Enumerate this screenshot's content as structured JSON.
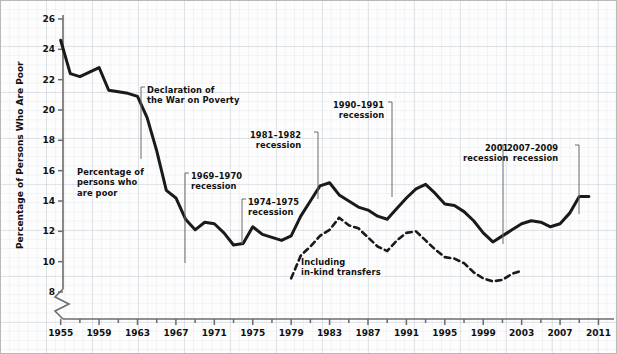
{
  "chart_data": {
    "type": "line",
    "title": "",
    "xlabel": "",
    "ylabel": "Percentage of Persons Who Are Poor",
    "xlim": [
      1954,
      2012
    ],
    "ylim": [
      7.2,
      26
    ],
    "y_axis_break": true,
    "grid": true,
    "legend_position": "inline-annotations",
    "y_ticks": [
      8,
      10,
      12,
      14,
      16,
      18,
      20,
      22,
      24,
      26
    ],
    "x_ticks": [
      1955,
      1959,
      1963,
      1967,
      1971,
      1975,
      1979,
      1983,
      1987,
      1991,
      1995,
      1999,
      2003,
      2007,
      2011
    ],
    "x_minor_tick_step": 2,
    "series": [
      {
        "name": "Percentage of persons who are poor",
        "style": "solid",
        "color": "#1a1a1a",
        "x": [
          1955,
          1956,
          1957,
          1958,
          1959,
          1960,
          1961,
          1962,
          1963,
          1964,
          1965,
          1966,
          1967,
          1968,
          1969,
          1970,
          1971,
          1972,
          1973,
          1974,
          1975,
          1976,
          1977,
          1978,
          1979,
          1980,
          1981,
          1982,
          1983,
          1984,
          1985,
          1986,
          1987,
          1988,
          1989,
          1990,
          1991,
          1992,
          1993,
          1994,
          1995,
          1996,
          1997,
          1998,
          1999,
          2000,
          2001,
          2002,
          2003,
          2004,
          2005,
          2006,
          2007,
          2008,
          2009,
          2010
        ],
        "values": [
          24.6,
          22.4,
          22.2,
          22.5,
          22.8,
          21.3,
          21.2,
          21.1,
          20.9,
          19.5,
          17.3,
          14.7,
          14.2,
          12.8,
          12.1,
          12.6,
          12.5,
          11.9,
          11.1,
          11.2,
          12.3,
          11.8,
          11.6,
          11.4,
          11.7,
          13.0,
          14.0,
          15.0,
          15.2,
          14.4,
          14.0,
          13.6,
          13.4,
          13.0,
          12.8,
          13.5,
          14.2,
          14.8,
          15.1,
          14.5,
          13.8,
          13.7,
          13.3,
          12.7,
          11.9,
          11.3,
          11.7,
          12.1,
          12.5,
          12.7,
          12.6,
          12.3,
          12.5,
          13.2,
          14.3,
          14.3
        ]
      },
      {
        "name": "Including in-kind transfers",
        "style": "dashed",
        "color": "#1a1a1a",
        "x": [
          1979,
          1980,
          1981,
          1982,
          1983,
          1984,
          1985,
          1986,
          1987,
          1988,
          1989,
          1990,
          1991,
          1992,
          1993,
          1994,
          1995,
          1996,
          1997,
          1998,
          1999,
          2000,
          2001,
          2002,
          2003
        ],
        "values": [
          8.9,
          10.4,
          11.0,
          11.7,
          12.1,
          12.9,
          12.4,
          12.2,
          11.6,
          11.0,
          10.7,
          11.4,
          11.9,
          12.0,
          11.4,
          10.8,
          10.3,
          10.2,
          9.9,
          9.3,
          8.9,
          8.7,
          8.8,
          9.2,
          9.4
        ]
      }
    ],
    "annotations": [
      {
        "id": "war-on-poverty",
        "lines": [
          "Declaration of",
          "the War on Poverty"
        ],
        "align": "left",
        "year": 1964
      },
      {
        "id": "poor-series-label",
        "lines": [
          "Percentage of",
          "persons who",
          "are poor"
        ],
        "align": "left"
      },
      {
        "id": "recession-1969-1970",
        "lines": [
          "1969–1970",
          "recession"
        ],
        "align": "left",
        "year": 1970
      },
      {
        "id": "recession-1974-1975",
        "lines": [
          "1974–1975",
          "recession"
        ],
        "align": "left",
        "year": 1975
      },
      {
        "id": "recession-1981-1982",
        "lines": [
          "1981–1982",
          "recession"
        ],
        "align": "right",
        "year": 1982
      },
      {
        "id": "recession-1990-1991",
        "lines": [
          "1990–1991",
          "recession"
        ],
        "align": "right",
        "year": 1991
      },
      {
        "id": "recession-2001",
        "lines": [
          "2001",
          "recession"
        ],
        "align": "right",
        "year": 2001
      },
      {
        "id": "recession-2007-2009",
        "lines": [
          "2007–2009",
          "recession"
        ],
        "align": "right",
        "year": 2008
      },
      {
        "id": "in-kind-label",
        "lines": [
          "Including",
          "in-kind transfers"
        ],
        "align": "left"
      }
    ]
  },
  "annotations_text": {
    "war_on_poverty_l1": "Declaration of",
    "war_on_poverty_l2": "the War on Poverty",
    "poor_l1": "Percentage of",
    "poor_l2": "persons who",
    "poor_l3": "are poor",
    "r6970_l1": "1969–1970",
    "r6970_l2": "recession",
    "r7475_l1": "1974–1975",
    "r7475_l2": "recession",
    "r8182_l1": "1981–1982",
    "r8182_l2": "recession",
    "r9091_l1": "1990–1991",
    "r9091_l2": "recession",
    "r2001_l1": "2001",
    "r2001_l2": "recession",
    "r0709_l1": "2007–2009",
    "r0709_l2": "recession",
    "inkind_l1": "Including",
    "inkind_l2": "in-kind transfers"
  },
  "axis": {
    "y_title": "Percentage of Persons Who Are Poor"
  },
  "colors": {
    "line": "#1a1a1a",
    "axis": "#6b6b6b",
    "text": "#111111",
    "grid": "#c8d2dc"
  }
}
